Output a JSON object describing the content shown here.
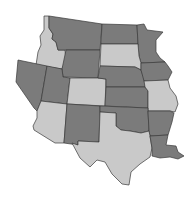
{
  "map": {
    "region": "Western and Central United States",
    "colors": {
      "dark": "#7b7b7b",
      "light": "#c9c9c9",
      "border": "#3a3a3a",
      "background": "#ffffff"
    },
    "states": [
      {
        "id": "ID",
        "name": "Idaho",
        "shade": "light"
      },
      {
        "id": "MT",
        "name": "Montana",
        "shade": "dark"
      },
      {
        "id": "ND",
        "name": "North Dakota",
        "shade": "dark"
      },
      {
        "id": "MN",
        "name": "Minnesota",
        "shade": "dark"
      },
      {
        "id": "WY",
        "name": "Wyoming",
        "shade": "dark"
      },
      {
        "id": "SD",
        "name": "South Dakota",
        "shade": "light"
      },
      {
        "id": "NV",
        "name": "Nevada",
        "shade": "dark"
      },
      {
        "id": "UT",
        "name": "Utah",
        "shade": "dark"
      },
      {
        "id": "CO",
        "name": "Colorado",
        "shade": "light"
      },
      {
        "id": "NE",
        "name": "Nebraska",
        "shade": "dark"
      },
      {
        "id": "IA",
        "name": "Iowa",
        "shade": "dark"
      },
      {
        "id": "KS",
        "name": "Kansas",
        "shade": "dark"
      },
      {
        "id": "MO",
        "name": "Missouri",
        "shade": "light"
      },
      {
        "id": "AZ",
        "name": "Arizona",
        "shade": "light"
      },
      {
        "id": "NM",
        "name": "New Mexico",
        "shade": "dark"
      },
      {
        "id": "OK",
        "name": "Oklahoma",
        "shade": "dark"
      },
      {
        "id": "AR",
        "name": "Arkansas",
        "shade": "dark"
      },
      {
        "id": "TX",
        "name": "Texas",
        "shade": "light"
      },
      {
        "id": "LA",
        "name": "Louisiana",
        "shade": "dark"
      }
    ]
  }
}
